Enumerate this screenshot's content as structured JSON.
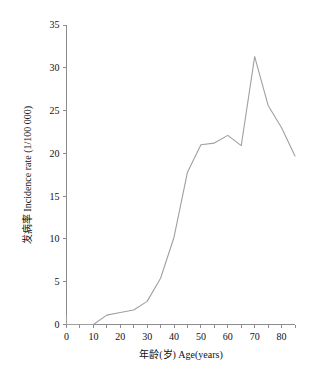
{
  "figure": {
    "background_color": "#ffffff",
    "line_color": "#a0a0a0",
    "axis_color": "#8c8c8c",
    "text_color": "#111111"
  },
  "chart_data": {
    "type": "line",
    "title": "",
    "subtitle": "",
    "xlabel": "年龄(岁) Age(years)",
    "ylabel": "发病率 Incidence  rate (1/100 000)",
    "xlim": [
      0,
      85
    ],
    "ylim": [
      0,
      35
    ],
    "xticks": [
      0,
      10,
      20,
      30,
      40,
      50,
      60,
      70,
      80
    ],
    "xtick_labels": [
      "0",
      "10",
      "20",
      "30",
      "40",
      "50",
      "60",
      "70",
      "80"
    ],
    "yticks": [
      0,
      5,
      10,
      15,
      20,
      25,
      30,
      35
    ],
    "ytick_labels": [
      "0",
      "5",
      "10",
      "15",
      "20",
      "25",
      "30",
      "35"
    ],
    "grid": false,
    "legend": null,
    "legend_position": "none",
    "series": [
      {
        "name": "Incidence rate",
        "x": [
          0,
          5,
          10,
          15,
          20,
          25,
          30,
          35,
          40,
          45,
          50,
          55,
          60,
          65,
          70,
          75,
          80,
          85
        ],
        "values": [
          0.0,
          0.0,
          0.0,
          1.1,
          1.4,
          1.7,
          2.7,
          5.4,
          10.2,
          17.8,
          21.0,
          21.2,
          22.1,
          20.9,
          31.3,
          25.6,
          23.0,
          19.7
        ]
      }
    ],
    "annotations": [
      {
        "name": "origin-spike",
        "x": 0,
        "y_from": 0.0,
        "y_to": 1.0,
        "description": "short vertical segment at age 0"
      }
    ]
  },
  "axes": {
    "x_axis_name": "age-axis",
    "y_axis_name": "incidence-axis"
  }
}
